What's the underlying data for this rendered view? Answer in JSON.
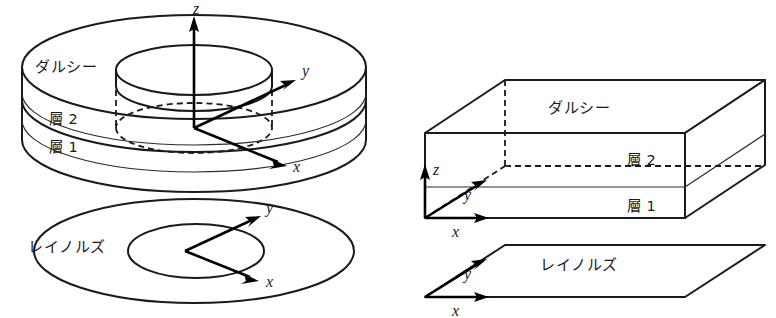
{
  "figure": {
    "title": "",
    "background_color": "#ffffff",
    "line_color": "#1a1a1a",
    "panels": [
      {
        "id": "left-panel",
        "geometry": "annular-cylinder",
        "name": "cylindrical-annulus-diagram"
      },
      {
        "id": "right-panel",
        "geometry": "rectangular-box",
        "name": "cartesian-box-diagram"
      }
    ]
  },
  "labels": {
    "darcy": "ダルシー",
    "layer2": "層 2",
    "layer1": "層 1",
    "reynolds": "レイノルズ"
  },
  "axes": {
    "x": "x",
    "y": "y",
    "z": "z"
  },
  "left_panel": {
    "solid": {
      "darcy_label": "ダルシー",
      "layer2_label": "層 2",
      "layer1_label": "層 1",
      "axis_z": "z",
      "axis_y": "y",
      "axis_x": "x"
    },
    "reynolds_annulus": {
      "label": "レイノルズ",
      "axis_y": "y",
      "axis_x": "x"
    }
  },
  "right_panel": {
    "box": {
      "darcy_label": "ダルシー",
      "layer2_label": "層 2",
      "layer1_label": "層 1",
      "axis_z": "z",
      "axis_y": "y",
      "axis_x": "x"
    },
    "reynolds_plane": {
      "label": "レイノルズ",
      "axis_y": "y",
      "axis_x": "x"
    }
  }
}
